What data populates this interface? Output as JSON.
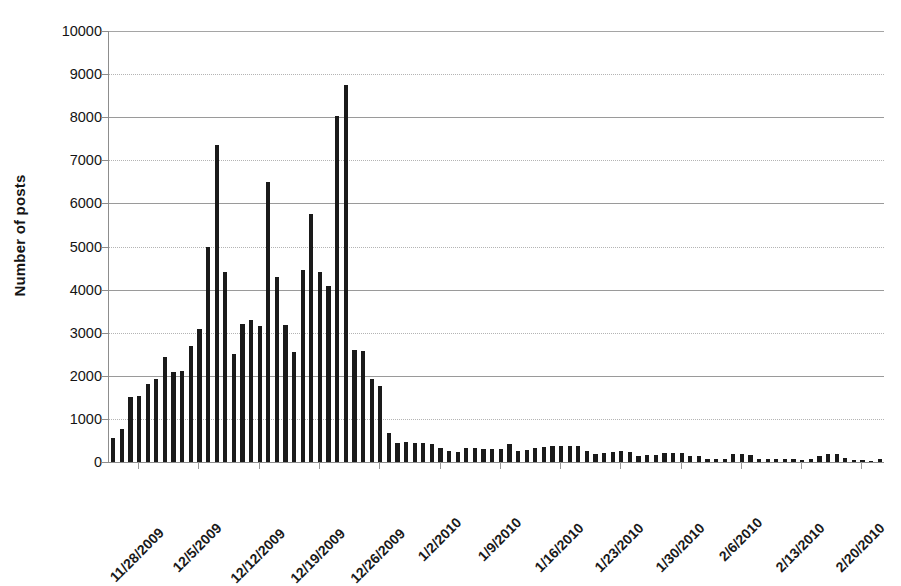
{
  "chart_data": {
    "type": "bar",
    "title": "",
    "xlabel": "",
    "ylabel": "Number of posts",
    "ylim": [
      0,
      10000
    ],
    "ytick_labels": [
      "10000",
      "9000",
      "8000",
      "7000",
      "6000",
      "5000",
      "4000",
      "3000",
      "2000",
      "1000",
      "0"
    ],
    "ytick_values": [
      10000,
      9000,
      8000,
      7000,
      6000,
      5000,
      4000,
      3000,
      2000,
      1000,
      0
    ],
    "grid": true,
    "legend": null,
    "bar_color": "#1a1a1a",
    "axis_color": "#8d8d8d",
    "grid_color": "#9a9a9a",
    "xtick_labels": [
      "11/28/2009",
      "12/5/2009",
      "12/12/2009",
      "12/19/2009",
      "12/26/2009",
      "1/2/2010",
      "1/9/2010",
      "1/16/2010",
      "1/23/2010",
      "1/30/2010",
      "2/6/2010",
      "2/13/2010",
      "2/20/2010"
    ],
    "xtick_indices": [
      3,
      10,
      17,
      24,
      31,
      38,
      45,
      52,
      59,
      66,
      73,
      80,
      87
    ],
    "categories": [
      "11/25/2009",
      "11/26/2009",
      "11/27/2009",
      "11/28/2009",
      "11/29/2009",
      "11/30/2009",
      "12/1/2009",
      "12/2/2009",
      "12/3/2009",
      "12/4/2009",
      "12/5/2009",
      "12/6/2009",
      "12/7/2009",
      "12/8/2009",
      "12/9/2009",
      "12/10/2009",
      "12/11/2009",
      "12/12/2009",
      "12/13/2009",
      "12/14/2009",
      "12/15/2009",
      "12/16/2009",
      "12/17/2009",
      "12/18/2009",
      "12/19/2009",
      "12/20/2009",
      "12/21/2009",
      "12/22/2009",
      "12/23/2009",
      "12/24/2009",
      "12/25/2009",
      "12/26/2009",
      "12/27/2009",
      "12/28/2009",
      "12/29/2009",
      "12/30/2009",
      "12/31/2009",
      "1/1/2010",
      "1/2/2010",
      "1/3/2010",
      "1/4/2010",
      "1/5/2010",
      "1/6/2010",
      "1/7/2010",
      "1/8/2010",
      "1/9/2010",
      "1/10/2010",
      "1/11/2010",
      "1/12/2010",
      "1/13/2010",
      "1/14/2010",
      "1/15/2010",
      "1/16/2010",
      "1/17/2010",
      "1/18/2010",
      "1/19/2010",
      "1/20/2010",
      "1/21/2010",
      "1/22/2010",
      "1/23/2010",
      "1/24/2010",
      "1/25/2010",
      "1/26/2010",
      "1/27/2010",
      "1/28/2010",
      "1/29/2010",
      "1/30/2010",
      "1/31/2010",
      "2/1/2010",
      "2/2/2010",
      "2/3/2010",
      "2/4/2010",
      "2/5/2010",
      "2/6/2010",
      "2/7/2010",
      "2/8/2010",
      "2/9/2010",
      "2/10/2010",
      "2/11/2010",
      "2/12/2010",
      "2/13/2010",
      "2/14/2010",
      "2/15/2010",
      "2/16/2010",
      "2/17/2010",
      "2/18/2010",
      "2/19/2010",
      "2/20/2010",
      "2/21/2010",
      "2/22/2010"
    ],
    "values": [
      560,
      760,
      1500,
      1540,
      1810,
      1930,
      2440,
      2100,
      2110,
      2700,
      3080,
      5000,
      7350,
      4400,
      2500,
      3200,
      3300,
      3150,
      6500,
      4300,
      3180,
      2550,
      4450,
      5750,
      4420,
      4080,
      8020,
      8750,
      2600,
      2580,
      1930,
      1760,
      670,
      430,
      460,
      440,
      430,
      410,
      330,
      250,
      240,
      330,
      320,
      310,
      310,
      300,
      420,
      250,
      290,
      320,
      350,
      380,
      380,
      370,
      360,
      260,
      190,
      210,
      230,
      250,
      230,
      150,
      160,
      170,
      200,
      210,
      200,
      150,
      140,
      60,
      60,
      80,
      190,
      180,
      170,
      80,
      70,
      80,
      70,
      60,
      50,
      80,
      140,
      190,
      190,
      100,
      50,
      40,
      30,
      60
    ]
  }
}
